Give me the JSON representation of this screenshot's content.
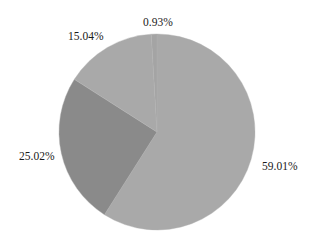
{
  "chart_data": {
    "type": "pie",
    "title": "",
    "start_angle_deg": 0,
    "direction": "clockwise",
    "slices": [
      {
        "label": "59.01%",
        "value": 59.01,
        "color": "#a9a9a9"
      },
      {
        "label": "25.02%",
        "value": 25.02,
        "color": "#8a8a8a"
      },
      {
        "label": "15.04%",
        "value": 15.04,
        "color": "#a9a9a9"
      },
      {
        "label": "0.93%",
        "value": 0.93,
        "color": "#a4a4a4"
      }
    ],
    "categories": [
      "59.01%",
      "25.02%",
      "15.04%",
      "0.93%"
    ],
    "values": [
      59.01,
      25.02,
      15.04,
      0.93
    ],
    "legend": null,
    "label_positions": [
      {
        "x": 262,
        "y": 170
      },
      {
        "x": 19,
        "y": 160
      },
      {
        "x": 68,
        "y": 40
      },
      {
        "x": 143,
        "y": 26
      }
    ],
    "center": {
      "x": 157,
      "y": 132
    },
    "radius": 98
  }
}
